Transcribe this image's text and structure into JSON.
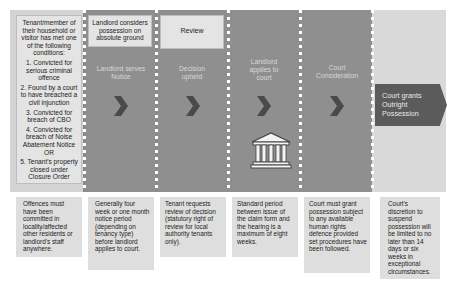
{
  "conditions_box": {
    "intro": "Tenant/member of their household or visitor has met one of the following conditions:",
    "items": [
      "1. Convicted for serious criminal offence",
      "2. Found by a court to have breached a civil injunction",
      "3. Convicted for breach of CBO",
      "4. Convicted for breach of Noise Abatement Notice OR",
      "5. Tenant's property closed under Closure Order"
    ]
  },
  "stages": [
    {
      "top_label": "Landlord considers possession on absolute ground",
      "title": "Landlord serves Notice",
      "note": "Generally four week or one month notice period (depending on tenancy type) before landlord applies to court."
    },
    {
      "top_label": "Review",
      "title": "Decision upheld",
      "note": "Tenant requests review of decision (statutory right of review for local authority tenants only)."
    },
    {
      "title": "Landlord applies to court",
      "icon": "courthouse-icon",
      "note": "Standard period between issue of the claim form and the hearing is a maximum of eight weeks."
    },
    {
      "title": "Court Consideration",
      "note": "Court must grant possession subject to any available human rights defence provided set procedures have been followed."
    }
  ],
  "outcome": {
    "label": "Court grants Outright Possession",
    "note": "Court's discretion to suspend possession will be limited to no later than 14 days or six weeks in exceptional circumstances."
  },
  "first_note": "Offences must have been committed in locality/affected other residents or landlord's staff anywhere.",
  "colors": {
    "stage_band": "#8f8f8f",
    "light_band": "#d4d4d4",
    "outcome_arrow": "#5b5b5b",
    "chevron": "#4a4a4a",
    "note_bg": "#dedede"
  }
}
